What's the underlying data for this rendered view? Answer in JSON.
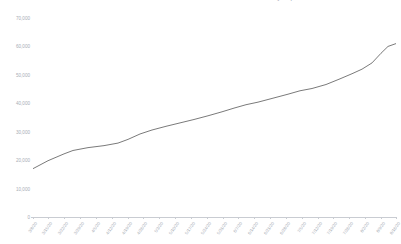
{
  "chart_data": {
    "type": "line",
    "title": "COVID-19 Cumulative Confirmed Cases Over Time — Total Cases by Report Date",
    "xlabel": "",
    "ylabel": "",
    "ylim": [
      0,
      70000
    ],
    "ytick_values": [
      0,
      10000,
      20000,
      30000,
      40000,
      50000,
      60000,
      70000
    ],
    "ytick_labels": [
      "0",
      "10,000",
      "20,000",
      "30,000",
      "40,000",
      "50,000",
      "60,000",
      "70,000"
    ],
    "grid": false,
    "legend": "none",
    "line_color": "#6b6b6b",
    "line_width": 0.9,
    "categories": [
      "3/8/20",
      "3/15/20",
      "3/22/20",
      "3/29/20",
      "4/5/20",
      "4/12/20",
      "4/19/20",
      "4/26/20",
      "5/3/20",
      "5/10/20",
      "5/17/20",
      "5/24/20",
      "5/31/20",
      "6/7/20",
      "6/14/20",
      "6/21/20",
      "6/28/20",
      "7/5/20",
      "7/12/20",
      "7/19/20",
      "7/26/20",
      "8/2/20",
      "8/9/20",
      "8/16/20"
    ],
    "values": [
      17000,
      19800,
      22200,
      24200,
      25000,
      26100,
      27300,
      29500,
      31600,
      33300,
      34800,
      36200,
      37600,
      39300,
      41000,
      42600,
      44200,
      45600,
      47400,
      49200,
      50900,
      53000,
      56200,
      59600
    ],
    "x_values": [
      33,
      48,
      64,
      80,
      96,
      112,
      128,
      143,
      159,
      175,
      191,
      207,
      223,
      238,
      254,
      270,
      286,
      302,
      318,
      333,
      349,
      365,
      381,
      396
    ],
    "first_value": 17000,
    "last_value": 61000,
    "points": [
      {
        "x": 33,
        "y": 17000
      },
      {
        "x": 48,
        "y": 19800
      },
      {
        "x": 64,
        "y": 22200
      },
      {
        "x": 73,
        "y": 23400
      },
      {
        "x": 88,
        "y": 24400
      },
      {
        "x": 104,
        "y": 25100
      },
      {
        "x": 118,
        "y": 26000
      },
      {
        "x": 128,
        "y": 27300
      },
      {
        "x": 140,
        "y": 29200
      },
      {
        "x": 152,
        "y": 30600
      },
      {
        "x": 166,
        "y": 31900
      },
      {
        "x": 180,
        "y": 33100
      },
      {
        "x": 194,
        "y": 34300
      },
      {
        "x": 208,
        "y": 35600
      },
      {
        "x": 222,
        "y": 37000
      },
      {
        "x": 234,
        "y": 38300
      },
      {
        "x": 246,
        "y": 39500
      },
      {
        "x": 258,
        "y": 40400
      },
      {
        "x": 272,
        "y": 41700
      },
      {
        "x": 288,
        "y": 43200
      },
      {
        "x": 300,
        "y": 44400
      },
      {
        "x": 312,
        "y": 45200
      },
      {
        "x": 326,
        "y": 46600
      },
      {
        "x": 340,
        "y": 48600
      },
      {
        "x": 352,
        "y": 50400
      },
      {
        "x": 362,
        "y": 52000
      },
      {
        "x": 372,
        "y": 54200
      },
      {
        "x": 381,
        "y": 57600
      },
      {
        "x": 388,
        "y": 60000
      },
      {
        "x": 396,
        "y": 61000
      }
    ]
  }
}
